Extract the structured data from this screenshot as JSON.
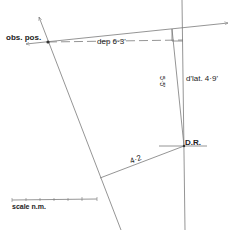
{
  "diagram": {
    "type": "navigation-plot",
    "labels": {
      "observed_position": "obs. pos.",
      "departure": "dep  6·3'",
      "difference_latitude": "d'lat. 4·9'",
      "leg_a": "5·5'",
      "dead_reckoning": "D.R.",
      "leg_b": "4·2",
      "scale": "scale  n.m."
    },
    "colors": {
      "line": "#7a7a7a",
      "text": "#222222",
      "background": "#ffffff"
    },
    "scale_bar": {
      "ticks": 6
    }
  }
}
